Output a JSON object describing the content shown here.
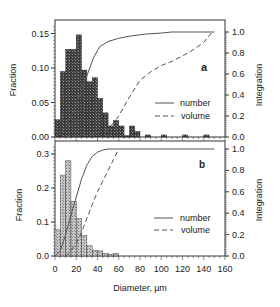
{
  "chart_data": [
    {
      "panel": "a",
      "type": "bar",
      "xlabel": "",
      "ylabel": "Fraction",
      "y2label": "Integration",
      "xlim": [
        0,
        160
      ],
      "ylim": [
        0,
        0.16
      ],
      "y2lim": [
        0,
        1.0
      ],
      "yticks": [
        "0.00",
        "0.05",
        "0.10",
        "0.15"
      ],
      "y2ticks": [
        "0.0",
        "0.2",
        "0.4",
        "0.6",
        "0.8",
        "1.0"
      ],
      "bin_width": 5,
      "bars": {
        "x_start": [
          0,
          5,
          10,
          15,
          20,
          25,
          30,
          35,
          40,
          45,
          50,
          55,
          60,
          65,
          70,
          75,
          85,
          100,
          120,
          140
        ],
        "values": [
          0.025,
          0.095,
          0.127,
          0.127,
          0.148,
          0.097,
          0.08,
          0.086,
          0.056,
          0.035,
          0.016,
          0.024,
          0.016,
          0.002,
          0.016,
          0.008,
          0.003,
          0.003,
          0.003,
          0.003
        ]
      },
      "series": [
        {
          "name": "number",
          "style": "solid",
          "x": [
            0,
            10,
            20,
            25,
            31,
            36,
            42,
            50,
            60,
            70,
            85,
            100,
            110,
            150
          ],
          "y": [
            0.0,
            0.08,
            0.3,
            0.45,
            0.61,
            0.75,
            0.86,
            0.91,
            0.94,
            0.96,
            0.98,
            0.99,
            1.0,
            1.0
          ]
        },
        {
          "name": "volume",
          "style": "dashed",
          "x": [
            10,
            20,
            30,
            40,
            50,
            60,
            70,
            80,
            90,
            100,
            110,
            127,
            140,
            148
          ],
          "y": [
            0.0,
            0.01,
            0.02,
            0.04,
            0.07,
            0.2,
            0.38,
            0.54,
            0.62,
            0.68,
            0.72,
            0.81,
            0.9,
            1.0
          ]
        }
      ],
      "legend": [
        "number",
        "volume"
      ],
      "label": "a"
    },
    {
      "panel": "b",
      "type": "bar",
      "xlabel": "Diameter, µm",
      "ylabel": "Fraction",
      "y2label": "Integration",
      "xlim": [
        0,
        160
      ],
      "ylim": [
        0,
        0.32
      ],
      "y2lim": [
        0,
        1.0
      ],
      "xticks": [
        "0",
        "20",
        "40",
        "60",
        "80",
        "100",
        "120",
        "140",
        "160"
      ],
      "yticks": [
        "0.0",
        "0.1",
        "0.2",
        "0.3"
      ],
      "y2ticks": [
        "0.0",
        "0.2",
        "0.4",
        "0.6",
        "0.8",
        "1.0"
      ],
      "bin_width": 5,
      "bars": {
        "x_start": [
          0,
          5,
          10,
          15,
          20,
          25,
          30,
          35,
          40,
          45,
          50,
          55
        ],
        "values": [
          0.077,
          0.238,
          0.28,
          0.16,
          0.11,
          0.06,
          0.03,
          0.017,
          0.015,
          0.008,
          0.004,
          0.008
        ]
      },
      "series": [
        {
          "name": "number",
          "style": "solid",
          "x": [
            0,
            5,
            10,
            15,
            20,
            25,
            30,
            35,
            40,
            45,
            50,
            60,
            150
          ],
          "y": [
            0.0,
            0.05,
            0.2,
            0.38,
            0.55,
            0.72,
            0.85,
            0.93,
            0.97,
            0.99,
            1.0,
            1.0,
            1.0
          ]
        },
        {
          "name": "volume",
          "style": "dashed",
          "x": [
            10,
            15,
            20,
            25,
            30,
            35,
            40,
            45,
            50,
            55,
            60
          ],
          "y": [
            0.0,
            0.05,
            0.12,
            0.22,
            0.35,
            0.48,
            0.6,
            0.7,
            0.8,
            0.9,
            1.0
          ]
        }
      ],
      "legend": [
        "number",
        "volume"
      ],
      "label": "b"
    }
  ],
  "labels": {
    "xlabel": "Diameter, µm",
    "ylabel_top": "Fraction",
    "ylabel_bottom": "Fraction",
    "y2label_top": "Integration",
    "y2label_bottom": "Integration",
    "legend_number": "number",
    "legend_volume": "volume",
    "panel_a": "a",
    "panel_b": "b"
  }
}
